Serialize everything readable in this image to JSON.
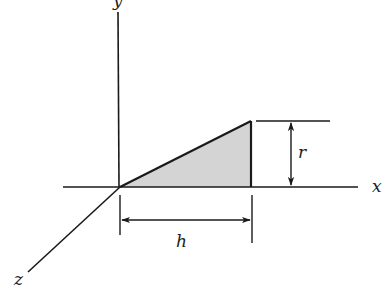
{
  "diagram": {
    "axes": {
      "x_label": "x",
      "y_label": "y",
      "z_label": "z"
    },
    "triangle": {
      "fill_color": "#d4d4d4",
      "stroke_color": "#1a1a1a"
    },
    "dimensions": {
      "height_label": "r",
      "base_label": "h"
    },
    "colors": {
      "line": "#1a1a1a",
      "background": "#ffffff"
    }
  }
}
